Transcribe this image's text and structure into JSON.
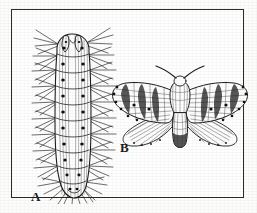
{
  "plate": {
    "background_color": "#fdfdfb",
    "frame_color": "#2b2b2b",
    "ink_color": "#1d1d1d",
    "interior_color": "#ffffff",
    "style": "engraving"
  },
  "figures": [
    {
      "key": "caterpillar",
      "label": "A",
      "subject": "hairy caterpillar",
      "orientation": "vertical",
      "segments": 10,
      "spot_rows": 2,
      "bristle_tufts": 22,
      "ink_color": "#1d1d1d"
    },
    {
      "key": "moth",
      "label": "B",
      "subject": "moth with spread wings",
      "orientation": "horizontal",
      "wings": 4,
      "antennae": 2,
      "forewing_bands": 4,
      "marginal_spots": 6,
      "ink_color": "#1d1d1d"
    }
  ],
  "labels": {
    "a": "A",
    "b": "B"
  }
}
